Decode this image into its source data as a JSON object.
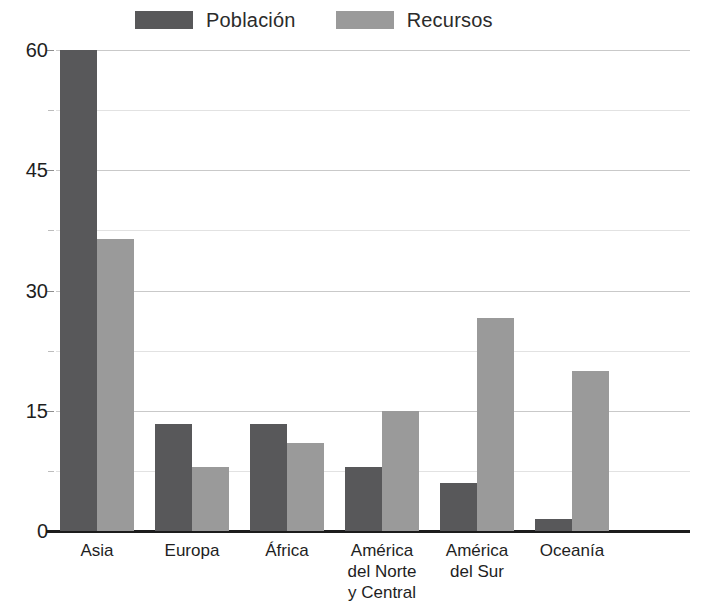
{
  "legend": {
    "position": "top-center",
    "entries": [
      {
        "label": "Población",
        "color": "#58585a",
        "swatch_name": "legend-swatch-poblacion"
      },
      {
        "label": "Recursos",
        "color": "#9a9a9a",
        "swatch_name": "legend-swatch-recursos"
      }
    ]
  },
  "axis": {
    "y_ticks": [
      "60",
      "45",
      "30",
      "15",
      "0"
    ],
    "y_tick_values": [
      60,
      45,
      30,
      15,
      0
    ],
    "y_minor_values": [
      52.5,
      37.5,
      22.5,
      7.5
    ]
  },
  "chart_data": {
    "type": "bar",
    "title": "",
    "subtitle": "",
    "xlabel": "",
    "ylabel": "",
    "ylim": [
      0,
      60
    ],
    "grid": true,
    "legend_position": "top-center",
    "categories": [
      "Asia",
      "Europa",
      "África",
      "América del Norte y Central",
      "América del Sur",
      "Oceanía"
    ],
    "category_lines": [
      [
        "Asia"
      ],
      [
        "Europa"
      ],
      [
        "África"
      ],
      [
        "América",
        "del Norte",
        "y Central"
      ],
      [
        "América",
        "del Sur"
      ],
      [
        "Oceanía"
      ]
    ],
    "series": [
      {
        "name": "Población",
        "color": "#58585a",
        "values": [
          60,
          13.4,
          13.4,
          8,
          6,
          1.5
        ]
      },
      {
        "name": "Recursos",
        "color": "#9a9a9a",
        "values": [
          36.4,
          8,
          11,
          15,
          26.6,
          20
        ]
      }
    ]
  }
}
